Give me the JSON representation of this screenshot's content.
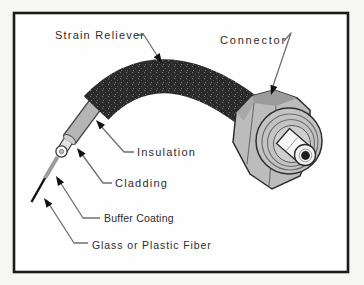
{
  "figure": {
    "labels": {
      "strain_reliever": "Strain Reliever",
      "connector": "Connector",
      "insulation": "Insulation",
      "cladding": "Cladding",
      "buffer_coating": "Buffer Coating",
      "glass_fiber": "Glass or Plastic Fiber"
    },
    "colors": {
      "background": "#f6f6f5",
      "panel": "#fefefe",
      "frame": "#1b1b1b",
      "cable_black": "#292929",
      "insulation_gray": "#b5b5b5",
      "cladding_light": "#e3e3e3",
      "buffer_gray": "#9c9c9c",
      "fiber_black": "#101010",
      "connector_gray": "#bcbcbc",
      "barrel_gray": "#c3c3c3",
      "ferrule_white": "#f7f7f7",
      "leader_gray": "#6f6f6f",
      "text": "#2d2d2d"
    }
  }
}
